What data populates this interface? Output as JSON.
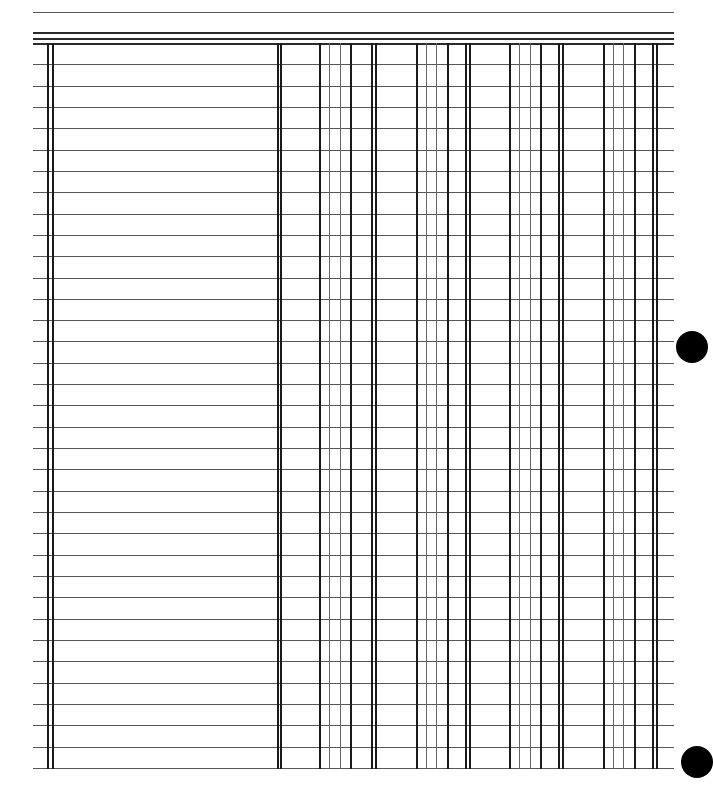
{
  "document": {
    "type": "blank-ledger-sheet",
    "row_count": 34,
    "rules": {
      "left_x": 33,
      "right_x": 674,
      "top_rule_y": 12,
      "header_rules_y": [
        32,
        38,
        43
      ],
      "first_row_y": 43,
      "row_height": 21.32,
      "bottom_y": 768
    },
    "columns": {
      "description_left_double": [
        47,
        52
      ],
      "description_right_double": [
        277,
        280
      ],
      "amount_groups": [
        {
          "lines": [
            319,
            329,
            340,
            350
          ],
          "double_end": [
            371,
            375
          ]
        },
        {
          "lines": [
            416,
            426,
            436,
            447
          ],
          "double_end": [
            465,
            469
          ]
        },
        {
          "lines": [
            509,
            519,
            530,
            540
          ],
          "double_end": [
            558,
            562
          ]
        },
        {
          "lines": [
            603,
            613,
            623,
            634
          ],
          "double_end": [
            652,
            656
          ]
        }
      ]
    },
    "punch_holes": [
      {
        "cx": 692,
        "cy": 347,
        "r": 16
      },
      {
        "cx": 697,
        "cy": 762,
        "r": 16
      }
    ],
    "colors": {
      "paper": "#ffffff",
      "rule": "#555555",
      "column_line": "#1a1a1a",
      "light_column_line": "#666666",
      "hole": "#000000"
    }
  }
}
